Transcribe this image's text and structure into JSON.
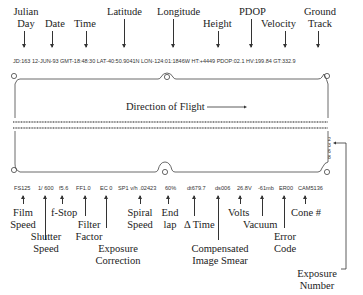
{
  "top_labels": {
    "julian_day": [
      "Julian",
      "Day"
    ],
    "date": "Date",
    "time": "Time",
    "latitude": "Latitude",
    "longitude": "Longitude",
    "height": "Height",
    "pdop": "PDOP",
    "velocity": "Velocity",
    "ground_track": [
      "Ground",
      "Track"
    ]
  },
  "top_data_strip": "JD:163 12-JUN-93 GMT-18:48:30 LAT-40:50.9041N LON-124:01:1846W HT:+4449 PDOP:02.1 HV:199.84 GT:332.9",
  "frame": {
    "direction_label": "Direction of Flight",
    "exposure_digits": [
      "2",
      "3",
      "6",
      "8"
    ]
  },
  "bottom_data": {
    "film_speed": "FS125",
    "shutter_speed": "1/ 600",
    "f_stop": "f5.6",
    "filter_factor": "FF1.0",
    "exposure_correction": "EC 0",
    "spiral_speed": "SP1 v/h .02423",
    "end_lap": "60%",
    "delta_time": "dt679.7",
    "ims": "ds006",
    "volts": "26.8V",
    "vacuum": "-61mb",
    "error_code": "ER00",
    "cone": "CAM5136"
  },
  "bottom_labels": {
    "film_speed": [
      "Film",
      "Speed"
    ],
    "shutter_speed": [
      "Shutter",
      "Speed"
    ],
    "f_stop": "f-Stop",
    "filter_factor": [
      "Filter",
      "Factor"
    ],
    "exposure_correction": [
      "Exposure",
      "Correction"
    ],
    "spiral_speed": [
      "Spiral",
      "Speed"
    ],
    "end_lap": [
      "End",
      "lap"
    ],
    "delta_time": "Δ Time",
    "ims": [
      "Compensated",
      "Image Smear"
    ],
    "volts": "Volts",
    "vacuum": "Vacuum",
    "error_code": [
      "Error",
      "Code"
    ],
    "cone": "Cone #",
    "exposure_number": [
      "Exposure",
      "Number"
    ]
  }
}
